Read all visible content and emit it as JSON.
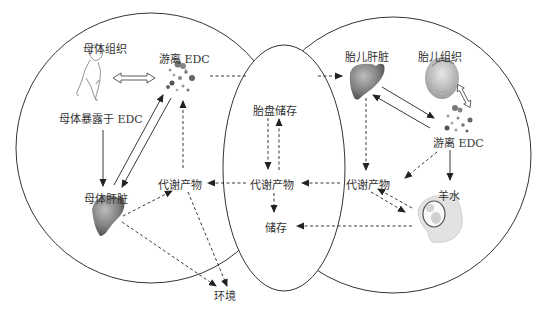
{
  "regions": {
    "maternal": "母体",
    "placenta": "胎盘",
    "fetal": "胎儿"
  },
  "labels": {
    "maternal_tissue": "母体组织",
    "maternal_free_edc": "游离 EDC",
    "maternal_exposure": "母体暴露于 EDC",
    "maternal_liver": "母体肝脏",
    "maternal_metabolites": "代谢产物",
    "environment": "环境",
    "placental_storage": "胎盘储存",
    "placental_metabolites": "代谢产物",
    "storage": "储存",
    "fetal_liver": "胎儿肝脏",
    "fetal_tissue": "胎儿组织",
    "fetal_free_edc": "游离 EDC",
    "fetal_metabolites": "代谢产物",
    "amniotic_fluid": "羊水"
  },
  "icons": {
    "maternal_body": "female-body-outline-icon",
    "maternal_liver": "liver-icon",
    "edc_particles": "particle-cluster-icon",
    "fetal_liver": "liver-icon",
    "fetus": "fetus-icon",
    "womb": "pregnant-womb-icon"
  },
  "colors": {
    "line": "#222222",
    "organ_dark": "#555555",
    "organ_light": "#9a9a9a"
  }
}
